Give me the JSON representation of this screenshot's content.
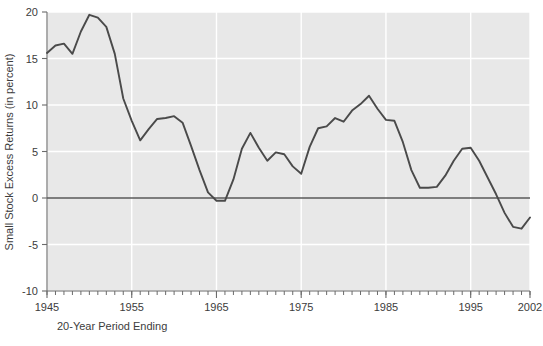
{
  "chart_data": {
    "type": "line",
    "title": "",
    "xlabel": "20-Year Period Ending",
    "ylabel": "Small Stock Excess Returns (in percent)",
    "xlim": [
      1945,
      2002
    ],
    "ylim": [
      -10,
      20
    ],
    "xticks": [
      1945,
      1955,
      1965,
      1975,
      1985,
      1995,
      2002
    ],
    "xtick_labels": [
      "1945",
      "1955",
      "1965",
      "1975",
      "1985",
      "1995",
      "2002"
    ],
    "xtick_minor_step": 1,
    "yticks": [
      -10,
      -5,
      0,
      5,
      10,
      15,
      20
    ],
    "ytick_labels": [
      "-10",
      "-5",
      "0",
      "5",
      "10",
      "15",
      "20"
    ],
    "grid": true,
    "grid_color": "#ffffff",
    "plot_background": "#e8e8e8",
    "line_color": "#4a4a4a",
    "zero_line": 0,
    "zero_line_color": "#5a5a5a",
    "legend": null,
    "series": [
      {
        "name": "Small Stock Excess Returns",
        "x": [
          1945,
          1946,
          1947,
          1948,
          1949,
          1950,
          1951,
          1952,
          1953,
          1954,
          1955,
          1956,
          1957,
          1958,
          1959,
          1960,
          1961,
          1962,
          1963,
          1964,
          1965,
          1966,
          1967,
          1968,
          1969,
          1970,
          1971,
          1972,
          1973,
          1974,
          1975,
          1976,
          1977,
          1978,
          1979,
          1980,
          1981,
          1982,
          1983,
          1984,
          1985,
          1986,
          1987,
          1988,
          1989,
          1990,
          1991,
          1992,
          1993,
          1994,
          1995,
          1996,
          1997,
          1998,
          1999,
          2000,
          2001,
          2002
        ],
        "values": [
          15.6,
          16.4,
          16.6,
          15.5,
          17.9,
          19.7,
          19.4,
          18.4,
          15.5,
          10.7,
          8.3,
          6.2,
          7.4,
          8.5,
          8.6,
          8.8,
          8.1,
          5.6,
          3.0,
          0.6,
          -0.3,
          -0.3,
          2.0,
          5.3,
          7.0,
          5.4,
          4.0,
          4.9,
          4.7,
          3.4,
          2.6,
          5.5,
          7.5,
          7.7,
          8.6,
          8.2,
          9.4,
          10.1,
          11.0,
          9.6,
          8.4,
          8.3,
          6.0,
          3.0,
          1.1,
          1.1,
          1.2,
          2.4,
          4.0,
          5.3,
          5.4,
          4.0,
          2.2,
          0.4,
          -1.6,
          -3.1,
          -3.3,
          -2.1
        ]
      }
    ]
  }
}
